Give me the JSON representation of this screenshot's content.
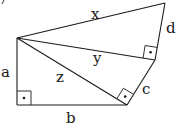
{
  "diagram": {
    "type": "geometry",
    "points": {
      "A": [
        17,
        38
      ],
      "B": [
        17,
        105
      ],
      "C": [
        127,
        105
      ],
      "D": [
        155,
        60
      ],
      "E": [
        165,
        3
      ]
    },
    "segments": [
      {
        "name": "a",
        "from": "A",
        "to": "B"
      },
      {
        "name": "b",
        "from": "B",
        "to": "C"
      },
      {
        "name": "c",
        "from": "C",
        "to": "D"
      },
      {
        "name": "d",
        "from": "D",
        "to": "E"
      },
      {
        "name": "x",
        "from": "A",
        "to": "E"
      },
      {
        "name": "y",
        "from": "A",
        "to": "D"
      },
      {
        "name": "z",
        "from": "A",
        "to": "C"
      }
    ],
    "right_angles": [
      "B",
      "C",
      "D"
    ],
    "labels": {
      "a": "a",
      "b": "b",
      "c": "c",
      "d": "d",
      "x": "x",
      "y": "y",
      "z": "z"
    },
    "colors": {
      "stroke": "#1a1a1a",
      "background": "#ffffff"
    }
  }
}
